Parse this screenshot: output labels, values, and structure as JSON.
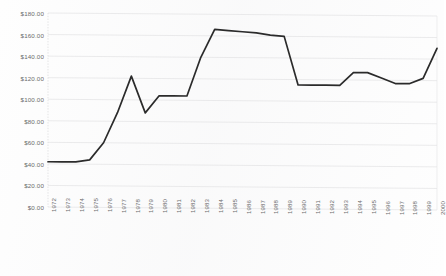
{
  "chart_data": {
    "type": "line",
    "title": "",
    "subtitle": "",
    "xlabel": "",
    "ylabel": "",
    "grid": true,
    "legend": false,
    "legend_position": "none",
    "line_color": "#2b2b2b",
    "grid_color": "#e2e2e4",
    "axis_text_color": "#5d5d60",
    "ylim": [
      0,
      180
    ],
    "ytick_step": 20,
    "ytick_labels": [
      "$0.00",
      "$20.00",
      "$40.00",
      "$60.00",
      "$80.00",
      "$100.00",
      "$120.00",
      "$140.00",
      "$160.00",
      "$180.00"
    ],
    "ytick_values": [
      0,
      20,
      40,
      60,
      80,
      100,
      120,
      140,
      160,
      180
    ],
    "categories": [
      "1972",
      "1973",
      "1974",
      "1975",
      "1976",
      "1977",
      "1978",
      "1979",
      "1980",
      "1981",
      "1982",
      "1983",
      "1984",
      "1985",
      "1986",
      "1987",
      "1988",
      "1989",
      "1990",
      "1991",
      "1992",
      "1993",
      "1994",
      "1995",
      "1996",
      "1997",
      "1998",
      "1999",
      "2000"
    ],
    "values": [
      42,
      42,
      42,
      44,
      60,
      88,
      122,
      88,
      104,
      104,
      104,
      140,
      166,
      165,
      164,
      163,
      161,
      160,
      115,
      115,
      115,
      115,
      127,
      127,
      122,
      117,
      117,
      122,
      150
    ],
    "series": [
      {
        "name": "Price",
        "values": [
          42,
          42,
          42,
          44,
          60,
          88,
          122,
          88,
          104,
          104,
          104,
          140,
          166,
          165,
          164,
          163,
          161,
          160,
          115,
          115,
          115,
          115,
          127,
          127,
          122,
          117,
          117,
          122,
          150
        ]
      }
    ]
  }
}
